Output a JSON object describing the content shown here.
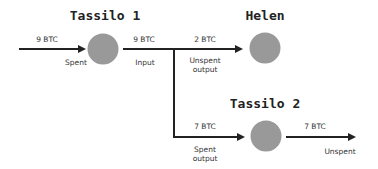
{
  "nodes": {
    "tassilo1": {
      "title": "Tassilo 1"
    },
    "helen": {
      "title": "Helen"
    },
    "tassilo2": {
      "title": "Tassilo 2"
    }
  },
  "edges": {
    "in_to_t1": {
      "amount": "9 BTC",
      "status": "Spent"
    },
    "t1_out": {
      "amount": "9 BTC",
      "status": "Input"
    },
    "to_helen": {
      "amount": "2 BTC",
      "status_line1": "Unspent",
      "status_line2": "output"
    },
    "to_t2": {
      "amount": "7 BTC",
      "status_line1": "Spent",
      "status_line2": "output"
    },
    "t2_out": {
      "amount": "7 BTC",
      "status": "Unspent"
    }
  },
  "colors": {
    "node_fill": "#999999",
    "line": "#222222",
    "background": "#ffffff"
  }
}
